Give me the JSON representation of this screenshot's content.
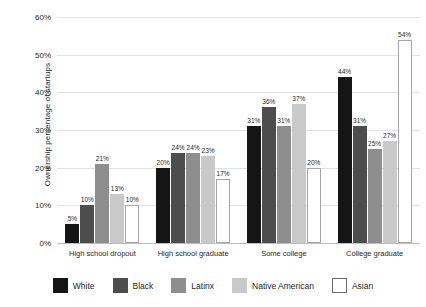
{
  "chart_data": {
    "type": "bar",
    "title": "",
    "xlabel": "",
    "ylabel": "Ownership percentage of startups",
    "ylim": [
      0,
      60
    ],
    "ytick_labels": [
      "0%",
      "10%",
      "20%",
      "30%",
      "40%",
      "50%",
      "60%"
    ],
    "ytick_values": [
      0,
      10,
      20,
      30,
      40,
      50,
      60
    ],
    "grid": true,
    "legend_position": "bottom",
    "categories": [
      "High school dropout",
      "High school graduate",
      "Some college",
      "College graduate"
    ],
    "series": [
      {
        "name": "White",
        "color": "#151515",
        "values": [
          5,
          20,
          31,
          44
        ],
        "labels": [
          "5%",
          "20%",
          "31%",
          "44%"
        ]
      },
      {
        "name": "Black",
        "color": "#4d4d4d",
        "values": [
          10,
          24,
          36,
          31
        ],
        "labels": [
          "10%",
          "24%",
          "36%",
          "31%"
        ]
      },
      {
        "name": "Latinx",
        "color": "#8e8e8e",
        "values": [
          21,
          24,
          31,
          25
        ],
        "labels": [
          "21%",
          "24%",
          "31%",
          "25%"
        ]
      },
      {
        "name": "Native American",
        "color": "#c9c9c9",
        "values": [
          13,
          23,
          37,
          27
        ],
        "labels": [
          "13%",
          "23%",
          "37%",
          "27%"
        ]
      },
      {
        "name": "Asian",
        "color": "#ffffff",
        "values": [
          10,
          17,
          20,
          54
        ],
        "labels": [
          "10%",
          "17%",
          "20%",
          "54%"
        ]
      }
    ]
  }
}
